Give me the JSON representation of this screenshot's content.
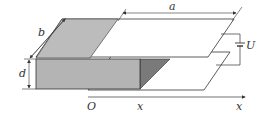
{
  "diagram": {
    "labels": {
      "a": "a",
      "b": "b",
      "d": "d",
      "U": "U",
      "origin": "O",
      "x_position": "x",
      "x_axis": "x"
    },
    "colors": {
      "line": "#333333",
      "dielectric_front": "#b4b4b4",
      "dielectric_top": "#bcbcbc",
      "dielectric_side": "#7a7a7a",
      "background": "#ffffff"
    }
  }
}
